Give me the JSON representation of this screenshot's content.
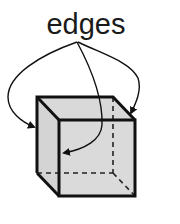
{
  "diagram": {
    "label": "edges",
    "colors": {
      "face_fill": "#d9d9d9",
      "stroke": "#111111",
      "background": "#ffffff"
    },
    "cube": {
      "back_top_left": [
        37,
        97
      ],
      "back_top_right": [
        113,
        97
      ],
      "front_top_left": [
        59,
        120
      ],
      "front_top_right": [
        135,
        120
      ],
      "back_bottom_left": [
        37,
        173
      ],
      "back_bottom_right": [
        113,
        173
      ],
      "front_bottom_left": [
        59,
        196
      ],
      "front_bottom_right": [
        135,
        196
      ]
    },
    "arrows": [
      {
        "name": "arrow-to-left-edge",
        "target": "back-left vertical edge"
      },
      {
        "name": "arrow-to-front-face-edge",
        "target": "front-left vertical edge"
      },
      {
        "name": "arrow-to-right-edge",
        "target": "top-right slanted edge"
      }
    ]
  }
}
